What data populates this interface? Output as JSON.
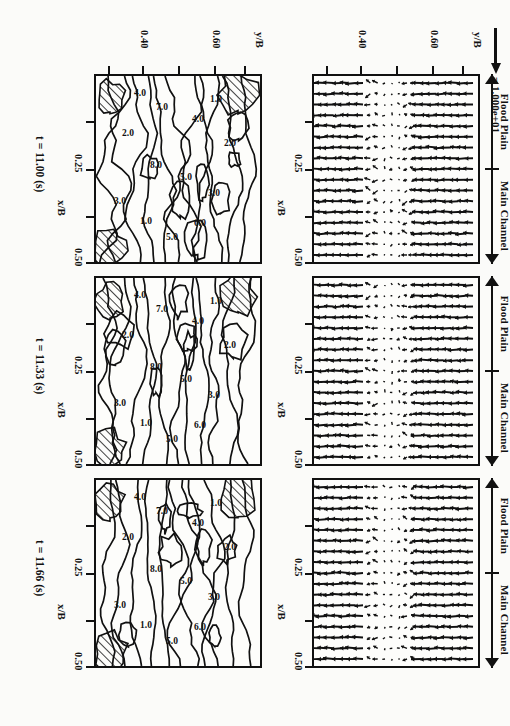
{
  "figure": {
    "type": "scientific-figure",
    "rotation_note": "printed rotated 90 degrees"
  },
  "vector_scale_legend": {
    "equals_sign": "=",
    "value": "1.000e+01",
    "full_label": "= 1.000e+01"
  },
  "region_bracket": {
    "main_channel_label": "Main Channel",
    "flood_plain_label": "Flood Plain"
  },
  "axes": {
    "x_axis_name": "x/B",
    "x_ticks": [
      "0.25",
      "0.50"
    ],
    "y_axis_name": "y/B",
    "y_ticks": [
      "0.40",
      "0.60"
    ]
  },
  "panels": [
    {
      "time_label": "t = 11.00 (s)",
      "row": "vectors",
      "column": 0
    },
    {
      "time_label": "t = 11.33 (s)",
      "row": "vectors",
      "column": 1
    },
    {
      "time_label": "t = 11.66 (s)",
      "row": "vectors",
      "column": 2
    },
    {
      "time_label": "t = 11.00 (s)",
      "row": "contours",
      "column": 0
    },
    {
      "time_label": "t = 11.33 (s)",
      "row": "contours",
      "column": 1
    },
    {
      "time_label": "t = 11.66 (s)",
      "row": "contours",
      "column": 2
    }
  ],
  "time_labels": {
    "t1": "t = 11.00 (s)",
    "t2": "t = 11.33 (s)",
    "t3": "t = 11.66 (s)"
  },
  "chart_data": {
    "type": "line",
    "xlabel": "x/B",
    "ylabel": "y/B",
    "xlim": [
      0.0,
      0.55
    ],
    "ylim": [
      0.3,
      0.7
    ],
    "xtick_values": [
      0.125,
      0.25,
      0.375,
      0.5
    ],
    "xtick_labels": [
      "",
      "0.25",
      "",
      "0.50"
    ],
    "ytick_values": [
      0.35,
      0.4,
      0.5,
      0.6,
      0.65
    ],
    "ytick_labels": [
      "",
      "0.40",
      "",
      "0.60",
      ""
    ],
    "grid": false,
    "legend_position": "none",
    "contour_levels": [
      1.0,
      2.0,
      3.0,
      4.0,
      5.0,
      6.0,
      7.0,
      8.0
    ],
    "contour_level_labels": [
      "1.0",
      "2.0",
      "3.0",
      "4.0",
      "5.0",
      "6.0",
      "7.0",
      "8.0"
    ],
    "region_boundary_y": 0.5,
    "regions": [
      {
        "name": "Flood Plain",
        "y_range": [
          0.3,
          0.5
        ]
      },
      {
        "name": "Main Channel",
        "y_range": [
          0.5,
          0.7
        ]
      }
    ],
    "vector_reference_magnitude": 10.0,
    "vector_reference_label": "1.000e+01",
    "series": [
      {
        "name": "t = 11.00 (s) vectors",
        "values": []
      },
      {
        "name": "t = 11.33 (s) vectors",
        "values": []
      },
      {
        "name": "t = 11.66 (s) vectors",
        "values": []
      },
      {
        "name": "t = 11.00 (s) contours",
        "values": [
          1.0,
          2.0,
          3.0,
          4.0,
          5.0,
          6.0,
          7.0,
          8.0
        ]
      },
      {
        "name": "t = 11.33 (s) contours",
        "values": [
          1.0,
          2.0,
          3.0,
          4.0,
          5.0,
          6.0,
          7.0,
          8.0
        ]
      },
      {
        "name": "t = 11.66 (s) contours",
        "values": [
          1.0,
          2.0,
          3.0,
          4.0,
          5.0,
          6.0,
          7.0,
          8.0
        ]
      }
    ]
  }
}
